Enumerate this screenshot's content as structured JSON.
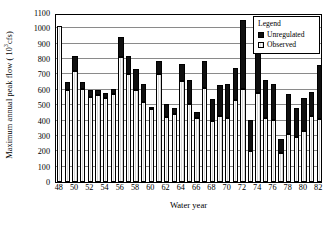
{
  "chart_data": {
    "type": "bar",
    "title": "",
    "subtitle": "",
    "xlabel": "Water year",
    "ylabel_prefix": "Maximum annual peak flow ( 10",
    "ylabel_sup": "3",
    "ylabel_suffix": "cfs)",
    "ylabel_full": "Maximum annual peak flow ( 10^3 cfs)",
    "ylim": [
      0,
      1100
    ],
    "ytick_step": 100,
    "yticks": [
      0,
      100,
      200,
      300,
      400,
      500,
      600,
      700,
      800,
      900,
      1000,
      1100
    ],
    "xticks": [
      "48",
      "50",
      "52",
      "54",
      "56",
      "58",
      "60",
      "62",
      "64",
      "66",
      "68",
      "70",
      "72",
      "74",
      "76",
      "78",
      "80",
      "82"
    ],
    "grid": "horizontal",
    "stacked": true,
    "legend": {
      "title": "Legend",
      "position": "top-right",
      "entries": [
        {
          "label": "Unregulated",
          "color": "#101010",
          "swatch": "unreg"
        },
        {
          "label": "Observed",
          "color": "#dedede",
          "swatch": "obs"
        }
      ]
    },
    "categories": [
      "48",
      "49",
      "50",
      "51",
      "52",
      "53",
      "54",
      "55",
      "56",
      "57",
      "58",
      "59",
      "60",
      "61",
      "62",
      "63",
      "64",
      "65",
      "66",
      "67",
      "68",
      "69",
      "70",
      "71",
      "72",
      "73",
      "74",
      "75",
      "76",
      "77",
      "78",
      "79",
      "80",
      "81",
      "82"
    ],
    "series": [
      {
        "name": "Observed",
        "values": [
          1015,
          600,
          720,
          605,
          555,
          565,
          545,
          570,
          815,
          700,
          600,
          520,
          475,
          700,
          425,
          440,
          660,
          510,
          415,
          615,
          400,
          430,
          415,
          535,
          605,
          205,
          580,
          415,
          405,
          190,
          310,
          290,
          335,
          430,
          410
        ]
      },
      {
        "name": "Unregulated",
        "values": [
          1015,
          650,
          820,
          650,
          600,
          600,
          580,
          605,
          945,
          820,
          735,
          640,
          490,
          790,
          505,
          480,
          770,
          665,
          455,
          785,
          540,
          630,
          640,
          740,
          1055,
          405,
          1015,
          665,
          635,
          280,
          570,
          485,
          545,
          585,
          760
        ]
      }
    ]
  }
}
